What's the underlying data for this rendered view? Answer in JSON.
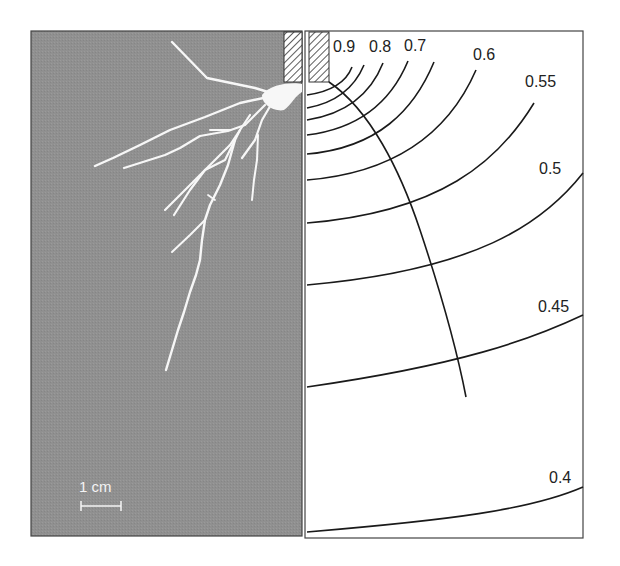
{
  "figure": {
    "left_panel": {
      "description": "Photograph of root system on grey background",
      "background_color": "#8f8f8f",
      "root_color": "#f8f8f8",
      "scale_bar": {
        "label": "1 cm"
      }
    },
    "right_panel": {
      "description": "Contour map with flow line",
      "contour_labels": [
        "0.9",
        "0.8",
        "0.7",
        "0.6",
        "0.55",
        "0.5",
        "0.45",
        "0.4"
      ]
    },
    "hatch_color": "#333333",
    "line_color": "#1a1a1a"
  }
}
